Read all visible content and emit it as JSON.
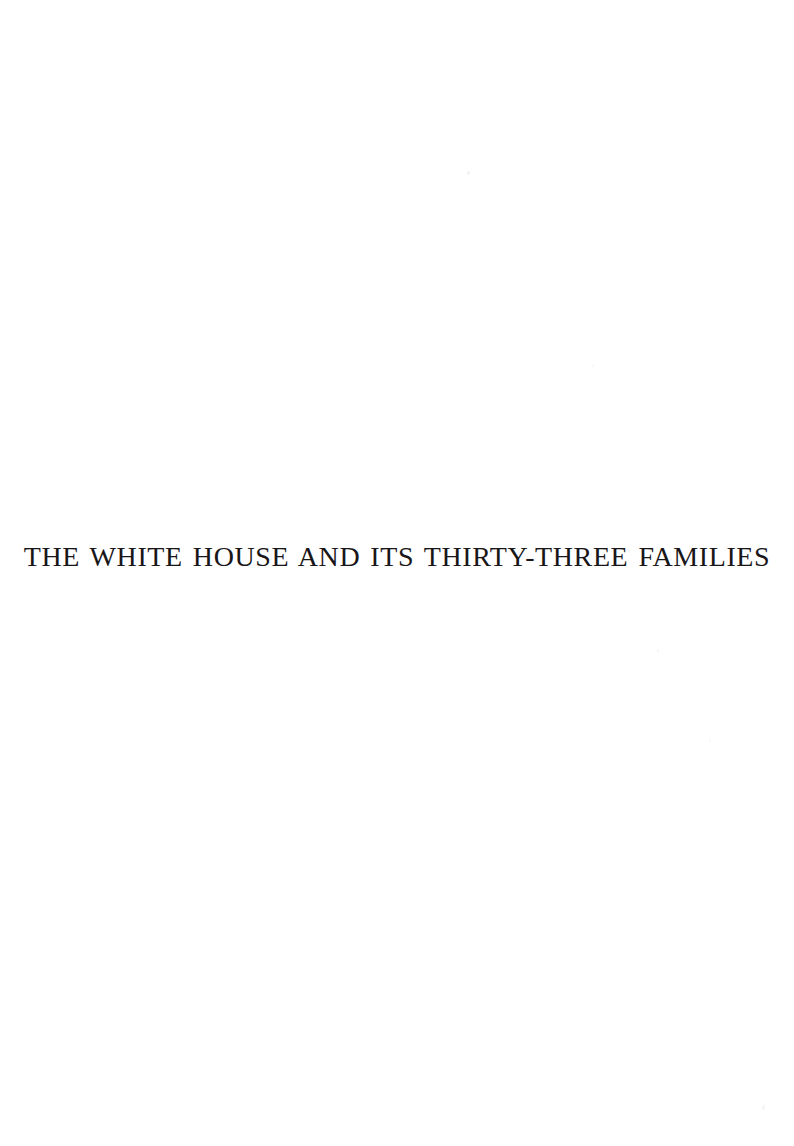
{
  "document": {
    "page_type": "half-title",
    "background_color": "#ffffff",
    "ink_color": "#191618",
    "title": "THE WHITE HOUSE AND ITS THIRTY-THREE FAMILIES"
  },
  "artifacts": {
    "description": "faint scanner speckles",
    "count": 5
  }
}
